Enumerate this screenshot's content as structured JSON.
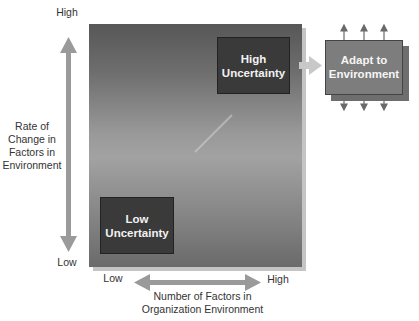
{
  "diagram": {
    "y_axis": {
      "label_lines": [
        "Rate of",
        "Change in",
        "Factors in",
        "Environment"
      ],
      "high": "High",
      "low": "Low"
    },
    "x_axis": {
      "label_lines": [
        "Number of Factors in",
        "Organization Environment"
      ],
      "high": "High",
      "low": "Low"
    },
    "boxes": {
      "high_uncertainty": [
        "High",
        "Uncertainty"
      ],
      "low_uncertainty": [
        "Low",
        "Uncertainty"
      ],
      "adapt": [
        "Adapt to",
        "Environment"
      ]
    },
    "colors": {
      "arrow": "#999999",
      "box_dark": "#3a3a3a",
      "adapt_box": "#7d7d7d",
      "adapt_arrows": "#666666",
      "text": "#333333"
    }
  }
}
